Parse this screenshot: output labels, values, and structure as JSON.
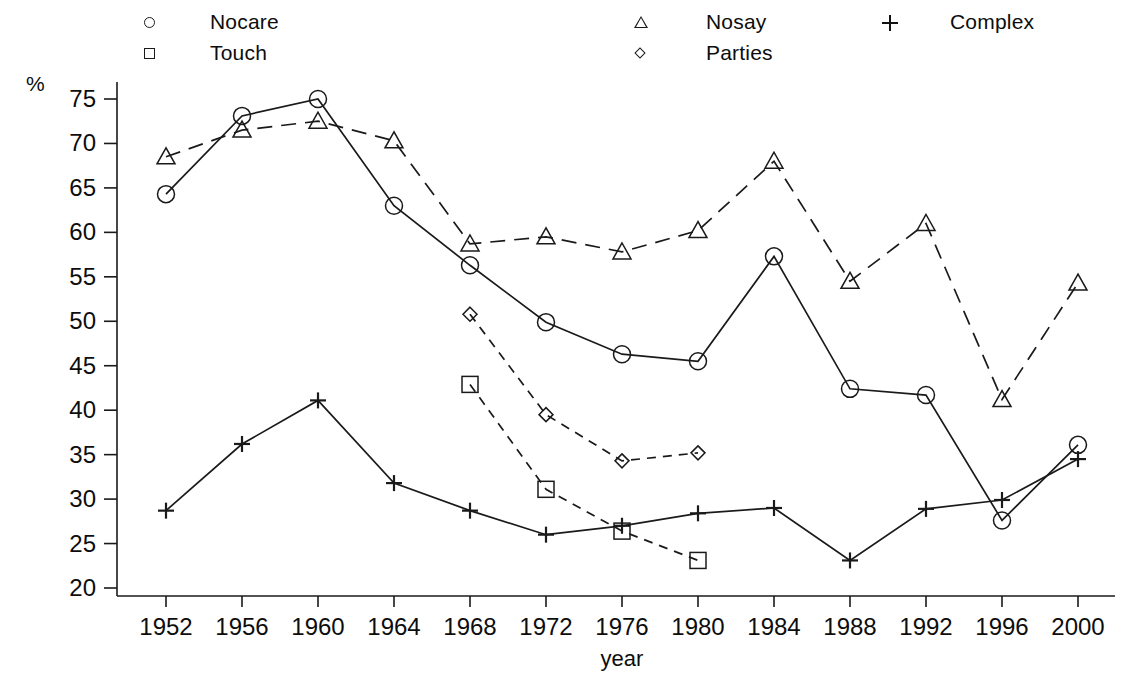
{
  "chart_data": {
    "type": "line",
    "title": "",
    "xlabel": "year",
    "ylabel": "%",
    "x": [
      1952,
      1956,
      1960,
      1964,
      1968,
      1972,
      1976,
      1980,
      1984,
      1988,
      1992,
      1996,
      2000
    ],
    "xtick_labels": [
      "1952",
      "1956",
      "1960",
      "1964",
      "1968",
      "1972",
      "1976",
      "1980",
      "1984",
      "1988",
      "1992",
      "1996",
      "2000"
    ],
    "ytick_labels": [
      "75",
      "70",
      "65",
      "60",
      "55",
      "50",
      "45",
      "40",
      "35",
      "30",
      "25",
      "20"
    ],
    "ytick_values": [
      75,
      70,
      65,
      60,
      55,
      50,
      45,
      40,
      35,
      30,
      25,
      20
    ],
    "ylim": [
      18.5,
      77.5
    ],
    "xlim": [
      1950,
      2002
    ],
    "grid": false,
    "legend_position": "top",
    "series": [
      {
        "name": "Nocare",
        "marker": "circle",
        "linestyle": "solid",
        "color": "#1a1a1a",
        "x": [
          1952,
          1956,
          1960,
          1964,
          1968,
          1972,
          1976,
          1980,
          1984,
          1988,
          1992,
          1996,
          2000
        ],
        "values": [
          64.3,
          73.1,
          75.0,
          63.0,
          56.3,
          49.9,
          46.3,
          45.5,
          57.3,
          42.4,
          41.7,
          27.6,
          36.1
        ]
      },
      {
        "name": "Touch",
        "marker": "square",
        "linestyle": "dashed",
        "color": "#1a1a1a",
        "x": [
          1968,
          1972,
          1976,
          1980
        ],
        "values": [
          42.9,
          31.1,
          26.4,
          23.1
        ]
      },
      {
        "name": "Nosay",
        "marker": "triangle",
        "linestyle": "long-dashed",
        "color": "#1a1a1a",
        "x": [
          1952,
          1956,
          1960,
          1964,
          1968,
          1972,
          1976,
          1980,
          1984,
          1988,
          1992,
          1996,
          2000
        ],
        "values": [
          68.5,
          71.5,
          72.5,
          70.3,
          58.7,
          59.5,
          57.8,
          60.2,
          68.0,
          54.5,
          61.0,
          41.2,
          54.3
        ]
      },
      {
        "name": "Parties",
        "marker": "diamond",
        "linestyle": "dashed",
        "color": "#1a1a1a",
        "x": [
          1968,
          1972,
          1976,
          1980
        ],
        "values": [
          50.8,
          39.5,
          34.3,
          35.2
        ]
      },
      {
        "name": "Complex",
        "marker": "plus",
        "linestyle": "solid",
        "color": "#1a1a1a",
        "x": [
          1952,
          1956,
          1960,
          1964,
          1968,
          1972,
          1976,
          1980,
          1984,
          1988,
          1992,
          1996,
          2000
        ],
        "values": [
          28.7,
          36.2,
          41.1,
          31.8,
          28.7,
          26.0,
          27.0,
          28.4,
          29.0,
          23.1,
          28.9,
          29.9,
          34.5
        ]
      }
    ]
  },
  "legend": {
    "entries": [
      {
        "label": "Nocare",
        "marker": "circle"
      },
      {
        "label": "Touch",
        "marker": "square"
      },
      {
        "label": "Nosay",
        "marker": "triangle"
      },
      {
        "label": "Parties",
        "marker": "diamond"
      },
      {
        "label": "Complex",
        "marker": "plus"
      }
    ]
  },
  "axes": {
    "y_unit": "%",
    "x_title": "year"
  }
}
